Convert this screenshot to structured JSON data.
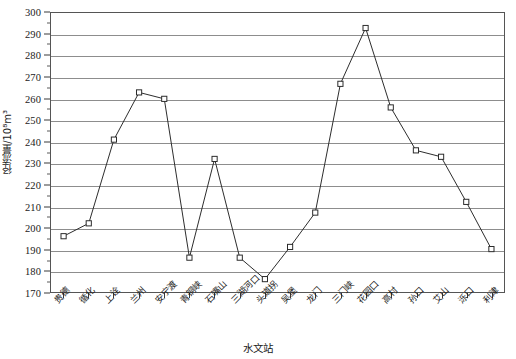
{
  "chart_data": {
    "type": "line",
    "title": "",
    "xlabel": "水文站",
    "ylabel": "径流量/10⁸m³",
    "ylim": [
      170,
      300
    ],
    "ytick_step": 10,
    "yticks": [
      170,
      180,
      190,
      200,
      210,
      220,
      230,
      240,
      250,
      260,
      270,
      280,
      290,
      300
    ],
    "grid": true,
    "legend": "none",
    "marker": "open-square",
    "line_color": "#2b2b2b",
    "grid_color": "#8d8d8d",
    "categories": [
      "贵德",
      "循化",
      "上诠",
      "兰州",
      "安宁渡",
      "青铜峡",
      "石嘴山",
      "三湖河口",
      "头道拐",
      "吴堡",
      "龙门",
      "三门峡",
      "花园口",
      "高村",
      "孙口",
      "艾山",
      "泺口",
      "利津"
    ],
    "values": [
      196,
      202,
      241,
      263,
      260,
      186,
      232,
      186,
      176,
      191,
      207,
      267,
      293,
      256,
      236,
      233,
      212,
      190
    ]
  },
  "axis": {
    "y_title": "径流量/10⁸m³",
    "x_title": "水文站"
  }
}
